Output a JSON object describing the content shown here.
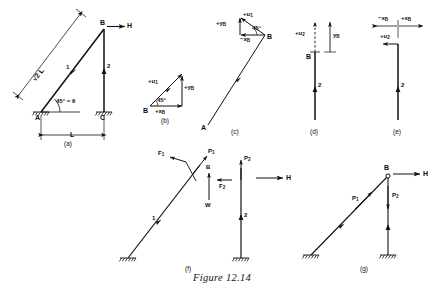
{
  "figure": {
    "caption": "Figure 12.14",
    "stroke_color": "#111111",
    "background": "#ffffff"
  },
  "panels": [
    {
      "id": "a",
      "label": "(a)"
    },
    {
      "id": "b",
      "label": "(b)"
    },
    {
      "id": "c",
      "label": "(c)"
    },
    {
      "id": "d",
      "label": "(d)"
    },
    {
      "id": "e",
      "label": "(e)"
    },
    {
      "id": "f",
      "label": "(f)"
    },
    {
      "id": "g",
      "label": "(g)"
    }
  ],
  "panel_a": {
    "node_a": "A",
    "node_b": "B",
    "node_c": "C",
    "force_h": "H",
    "member_1": "1",
    "member_2": "2",
    "angle": "45° = θ",
    "diagonal_length": "√2 L",
    "span_label": "L"
  },
  "panel_b": {
    "node_b": "B",
    "u1": "+u",
    "u1_sub": "1",
    "y_b": "+y",
    "y_b_sub": "B",
    "x_b": "+x",
    "x_b_sub": "B",
    "angle": "45°"
  },
  "panel_c": {
    "node_b": "B",
    "node_a": "A",
    "u1": "+u",
    "u1_sub": "1",
    "y_b": "+y",
    "y_b_sub": "B",
    "x_b": "−x",
    "x_b_sub": "B",
    "angle": "45°"
  },
  "panel_d": {
    "node_b": "B",
    "u2": "+u",
    "u2_sub": "2",
    "y_b": "y",
    "y_b_sub": "B",
    "member_2": "2"
  },
  "panel_e": {
    "u2": "+u",
    "u2_sub": "2",
    "x_b_neg": "−x",
    "x_b_neg_sub": "B",
    "x_b_pos": "+x",
    "x_b_pos_sub": "B",
    "member_2": "2"
  },
  "panel_f": {
    "node_b": "B",
    "member_1": "1",
    "member_2": "2",
    "force_f1": "F",
    "force_f1_sub": "1",
    "force_f2": "F",
    "force_f2_sub": "2",
    "force_p1": "P",
    "force_p1_sub": "1",
    "force_p2": "P",
    "force_p2_sub": "2",
    "force_w": "W",
    "force_h": "H"
  },
  "panel_g": {
    "node_b": "B",
    "force_h": "H",
    "force_p1": "P",
    "force_p1_sub": "1",
    "force_p2": "P",
    "force_p2_sub": "2"
  }
}
